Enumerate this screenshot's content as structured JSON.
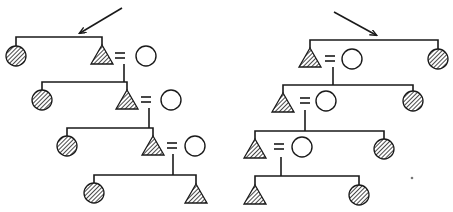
{
  "figure": {
    "legend": {
      "triangle_hatched": "affected male",
      "circle_hatched": "affected female",
      "circle_open": "unaffected spouse",
      "equals": "marriage"
    },
    "colors": {
      "ink": "#1a1a1a",
      "background": "#ffffff"
    }
  },
  "pedigrees": [
    {
      "id": "left",
      "arrow": {
        "from": [
          122,
          8
        ],
        "to": [
          80,
          33
        ]
      },
      "generations": [
        {
          "sibline": [
            16,
            102,
            37
          ],
          "left": {
            "type": "circle-hatched",
            "x": 16,
            "y": 56
          },
          "right": {
            "type": "triangle-hatched",
            "x": 102,
            "y": 55
          },
          "spouse": {
            "type": "circle-open",
            "x": 146,
            "y": 56,
            "eq_x": 120
          },
          "drop": {
            "x": 124,
            "y1": 64,
            "y2": 82
          }
        },
        {
          "sibline": [
            42,
            127,
            82
          ],
          "left": {
            "type": "circle-hatched",
            "x": 42,
            "y": 100
          },
          "right": {
            "type": "triangle-hatched",
            "x": 127,
            "y": 100
          },
          "spouse": {
            "type": "circle-open",
            "x": 171,
            "y": 100,
            "eq_x": 146
          },
          "drop": {
            "x": 149,
            "y1": 108,
            "y2": 128
          }
        },
        {
          "sibline": [
            67,
            153,
            128
          ],
          "left": {
            "type": "circle-hatched",
            "x": 67,
            "y": 146
          },
          "right": {
            "type": "triangle-hatched",
            "x": 153,
            "y": 146
          },
          "spouse": {
            "type": "circle-open",
            "x": 195,
            "y": 146,
            "eq_x": 172
          },
          "drop": {
            "x": 173,
            "y1": 154,
            "y2": 175
          }
        },
        {
          "sibline": [
            94,
            196,
            175
          ],
          "left": {
            "type": "circle-hatched",
            "x": 94,
            "y": 193
          },
          "right": {
            "type": "triangle-hatched",
            "x": 196,
            "y": 194
          }
        }
      ]
    },
    {
      "id": "right",
      "arrow": {
        "from": [
          334,
          12
        ],
        "to": [
          376,
          35
        ]
      },
      "generations": [
        {
          "sibline": [
            310,
            438,
            40
          ],
          "left": {
            "type": "triangle-hatched",
            "x": 310,
            "y": 58
          },
          "spouse": {
            "type": "circle-open",
            "x": 352,
            "y": 59,
            "eq_x": 330
          },
          "right": {
            "type": "circle-hatched",
            "x": 438,
            "y": 59
          },
          "drop": {
            "x": 333,
            "y1": 67,
            "y2": 85
          }
        },
        {
          "sibline": [
            283,
            413,
            85
          ],
          "left": {
            "type": "triangle-hatched",
            "x": 283,
            "y": 103
          },
          "spouse": {
            "type": "circle-open",
            "x": 326,
            "y": 101,
            "eq_x": 305
          },
          "right": {
            "type": "circle-hatched",
            "x": 413,
            "y": 101
          },
          "drop": {
            "x": 305,
            "y1": 110,
            "y2": 131
          }
        },
        {
          "sibline": [
            255,
            385,
            131
          ],
          "left": {
            "type": "triangle-hatched",
            "x": 255,
            "y": 149
          },
          "spouse": {
            "type": "circle-open",
            "x": 302,
            "y": 147,
            "eq_x": 279
          },
          "right": {
            "type": "circle-hatched",
            "x": 384,
            "y": 149
          },
          "drop": {
            "x": 281,
            "y1": 157,
            "y2": 176
          }
        },
        {
          "sibline": [
            255,
            359,
            176
          ],
          "left": {
            "type": "triangle-hatched",
            "x": 255,
            "y": 195
          },
          "right": {
            "type": "circle-hatched",
            "x": 359,
            "y": 195
          }
        }
      ]
    }
  ],
  "artifacts": [
    {
      "type": "dot",
      "x": 412,
      "y": 178
    }
  ]
}
